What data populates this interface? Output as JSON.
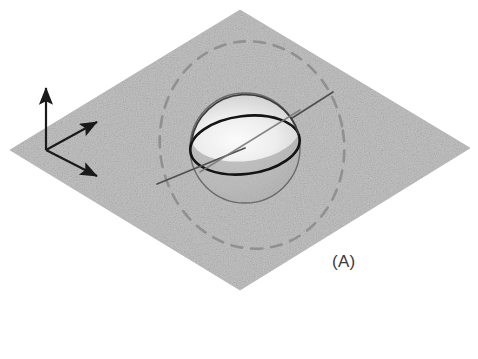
{
  "figure": {
    "panel_label": "(A)",
    "caption_corner": "bottom-right",
    "background_color": "#ffffff"
  },
  "colors": {
    "plane_fill": "#c2c2c2",
    "plane_fill_light": "#cfcfcf",
    "plane_speckle": "#a8a8a8",
    "axis_stroke": "#1a1a1a",
    "sphere_outline": "#5f5f5f",
    "equator_stroke": "#111111",
    "spin_axis_stroke": "#4a4a4a",
    "orbit_dashed_stroke": "#8e8e8e",
    "sphere_highlight": "#f2f2f2",
    "sphere_shade": "#bdbdbd",
    "label_color": "#3a3a3a"
  },
  "plane": {
    "name": "equatorial-reference-plane",
    "shape": "rhombus",
    "vertices": [
      {
        "x": 240,
        "y": 10
      },
      {
        "x": 470,
        "y": 148
      },
      {
        "x": 240,
        "y": 290
      },
      {
        "x": 10,
        "y": 150
      }
    ]
  },
  "axes": {
    "origin": {
      "x": 46,
      "y": 150
    },
    "arrows": [
      {
        "name": "z-axis-arrow",
        "label": "",
        "direction": "up",
        "tip": {
          "x": 46,
          "y": 84
        }
      },
      {
        "name": "y-axis-arrow",
        "label": "",
        "direction": "up-right",
        "tip": {
          "x": 101,
          "y": 119
        }
      },
      {
        "name": "x-axis-arrow",
        "label": "",
        "direction": "down-right",
        "tip": {
          "x": 101,
          "y": 179
        }
      }
    ]
  },
  "sphere": {
    "name": "rotating-sphere",
    "center": {
      "x": 245,
      "y": 148
    },
    "radius": 55,
    "equator": {
      "name": "equator-ellipse",
      "center": {
        "x": 245,
        "y": 145
      },
      "rx": 55,
      "ry": 29,
      "rotation_deg": -7
    }
  },
  "spin_axis": {
    "name": "spin-axis-line",
    "start": {
      "x": 157,
      "y": 184
    },
    "end": {
      "x": 333,
      "y": 92
    },
    "style": "solid-thin"
  },
  "orbit": {
    "name": "orbital-path-dashed-ellipse",
    "center": {
      "x": 252,
      "y": 145
    },
    "rx": 92,
    "ry": 104,
    "rotation_deg": -9,
    "style": "dashed"
  }
}
